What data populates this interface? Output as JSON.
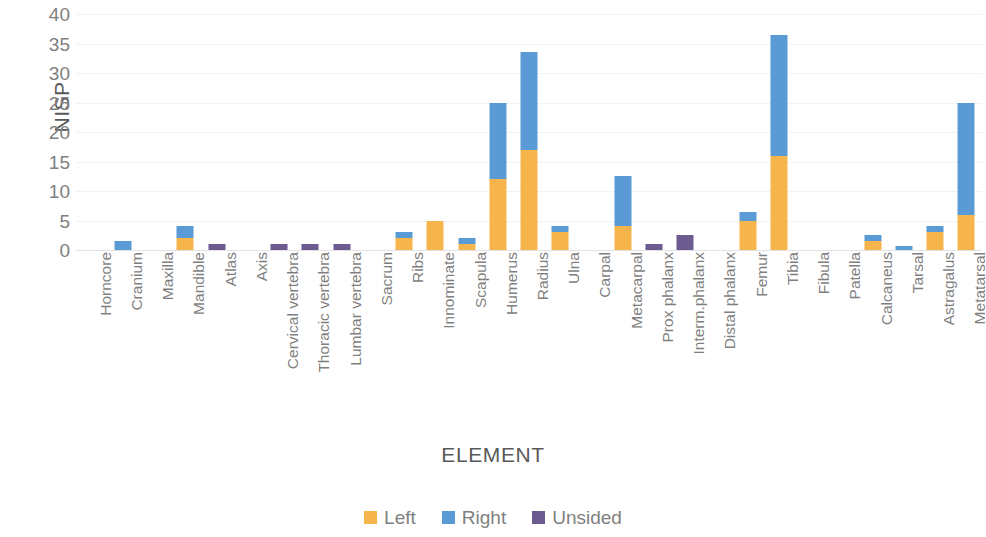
{
  "chart_data": {
    "type": "bar",
    "subtype": "stacked-column",
    "title": "",
    "xlabel": "ELEMENT",
    "ylabel": "NISP",
    "ylim": [
      0,
      40
    ],
    "yticks": [
      0,
      5,
      10,
      15,
      20,
      25,
      30,
      35,
      40
    ],
    "grid": true,
    "legend_position": "bottom",
    "categories": [
      "Horncore",
      "Cranium",
      "Maxilla",
      "Mandible",
      "Atlas",
      "Axis",
      "Cervical vertebra",
      "Thoracic vertebra",
      "Lumbar vertebra",
      "Sacrum",
      "Ribs",
      "Innominate",
      "Scapula",
      "Humerus",
      "Radius",
      "Ulna",
      "Carpal",
      "Metacarpal",
      "Prox phalanx",
      "Interm.phalanx",
      "Distal phalanx",
      "Femur",
      "Tibia",
      "Fibula",
      "Patella",
      "Calcaneus",
      "Tarsal",
      "Astragalus",
      "Metatarsal"
    ],
    "series": [
      {
        "name": "Left",
        "color": "#F5B44C",
        "values": [
          0,
          0,
          0,
          2,
          0,
          0,
          0,
          0,
          0,
          0,
          2,
          5,
          1,
          12,
          17,
          3,
          0,
          4,
          0,
          0,
          0,
          5,
          16,
          0,
          0,
          1.5,
          0,
          3,
          6
        ]
      },
      {
        "name": "Right",
        "color": "#5B9BD5",
        "values": [
          0,
          1.5,
          0,
          2,
          0,
          0,
          0,
          0,
          0,
          0,
          1,
          0,
          1,
          13,
          16.5,
          1,
          0,
          8.5,
          0,
          0,
          0,
          1.5,
          20.5,
          0,
          0,
          1,
          0.7,
          1,
          19
        ]
      },
      {
        "name": "Unsided",
        "color": "#6B5B8E",
        "values": [
          0,
          0,
          0,
          0,
          1,
          0,
          1,
          1,
          1,
          0,
          0,
          0,
          0,
          0,
          0,
          0,
          0,
          0,
          1,
          2.5,
          0,
          0,
          0,
          0,
          0,
          0,
          0,
          0,
          0
        ]
      }
    ],
    "totals": [
      0,
      1.5,
      0,
      4,
      1,
      0,
      1,
      1,
      1,
      0,
      3,
      5,
      2,
      25,
      33.5,
      4,
      0,
      12.5,
      1,
      2.5,
      0,
      6.5,
      36.5,
      0,
      0,
      2.5,
      0.7,
      4,
      25
    ]
  }
}
